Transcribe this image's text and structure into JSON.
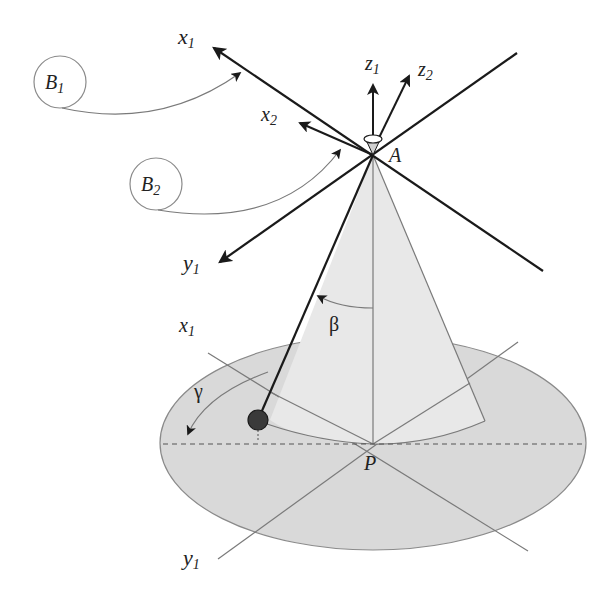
{
  "diagram": {
    "type": "cone-pendulum-coordinate-frames",
    "labels": {
      "x1_top": "x",
      "x1_top_sub": "1",
      "x2": "x",
      "x2_sub": "2",
      "z1": "z",
      "z1_sub": "1",
      "z2": "z",
      "z2_sub": "2",
      "y1_top": "y",
      "y1_top_sub": "1",
      "apex": "A",
      "base_center": "P",
      "x1_base": "x",
      "x1_base_sub": "1",
      "y1_base": "y",
      "y1_base_sub": "1",
      "beta": "β",
      "gamma": "γ",
      "frame_b1": "B",
      "frame_b1_sub": "1",
      "frame_b2": "B",
      "frame_b2_sub": "2"
    },
    "colors": {
      "ellipse_fill": "#d9d9d9",
      "cone_fill": "#e6e6e6",
      "axis_stroke": "#1a1a1a",
      "thin_stroke": "#7a7a7a",
      "ball_fill": "#3a3a3a"
    }
  }
}
